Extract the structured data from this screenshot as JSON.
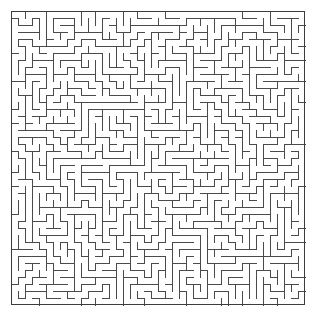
{
  "page": {
    "background_color": "#ffffff",
    "width": 316,
    "height": 321
  },
  "maze": {
    "name": "maze-grid",
    "type": "perfect-maze",
    "cols": 42,
    "rows": 42,
    "cell_size": 7,
    "origin_x": 11,
    "origin_y": 11,
    "wall_color": "#4a4a4a",
    "border_color": "#3c3c3c",
    "wall_thickness": 1,
    "border_thickness": 1,
    "background_color": "#ffffff",
    "outer_border": true,
    "entrance": null,
    "exit": null,
    "seed": 20250714,
    "description": "Dense square perfect maze drawn as thin dark gray lines on a white background with a solid outer boundary.",
    "labels": [],
    "annotations": []
  }
}
